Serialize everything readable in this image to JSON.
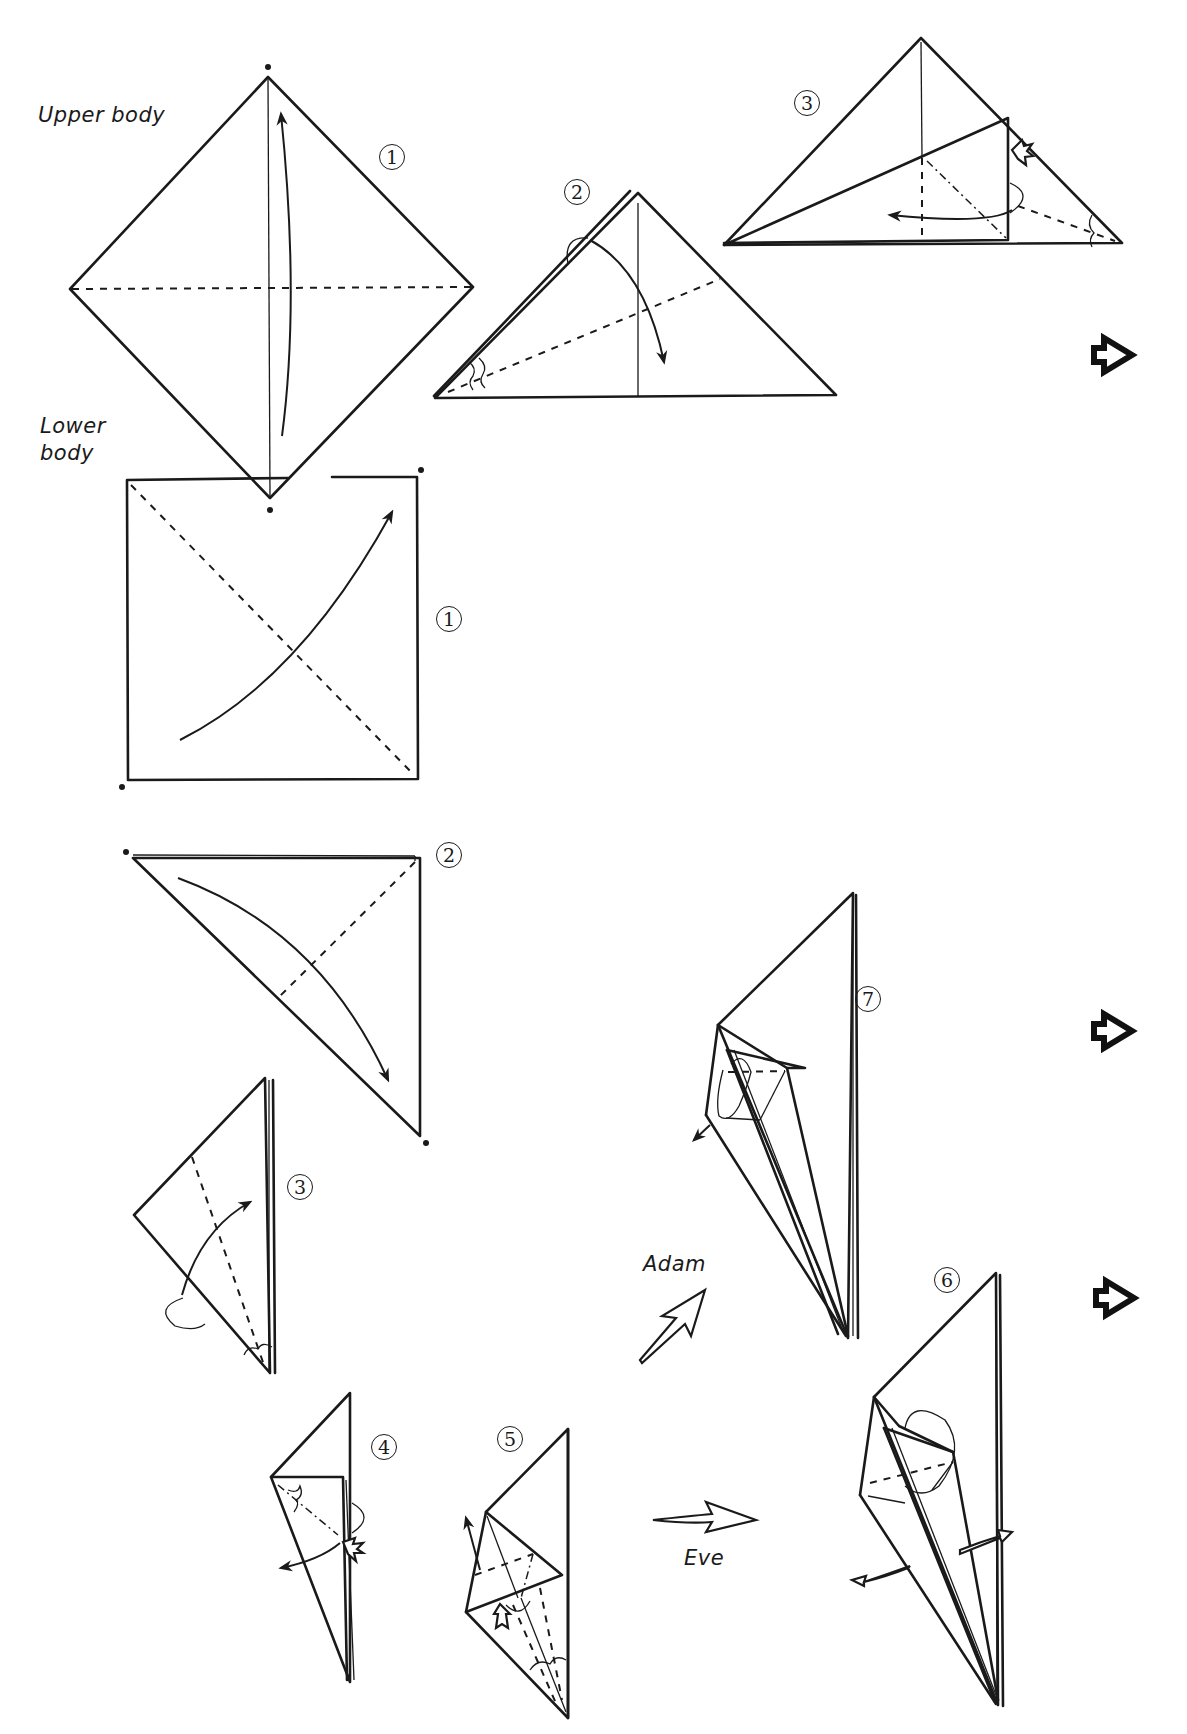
{
  "labels": {
    "upper_body": "Upper body",
    "lower_body": "Lower body",
    "adam": "Adam",
    "eve": "Eve"
  },
  "upper_body_steps": [
    {
      "number": "1",
      "glyph": "①"
    },
    {
      "number": "2",
      "glyph": "②"
    },
    {
      "number": "3",
      "glyph": "③"
    }
  ],
  "lower_body_steps": [
    {
      "number": "1",
      "glyph": "①"
    },
    {
      "number": "2",
      "glyph": "②"
    },
    {
      "number": "3",
      "glyph": "③"
    },
    {
      "number": "4",
      "glyph": "④"
    },
    {
      "number": "5",
      "glyph": "⑤"
    },
    {
      "number": "6",
      "glyph": "⑥"
    },
    {
      "number": "7",
      "glyph": "⑦"
    }
  ],
  "icons": {
    "next_arrow": "bold-hollow-right-arrow",
    "fold_arrow": "curved-fold-arrow",
    "push_arrow": "hollow-push-arrow",
    "reference_dot": "dot"
  },
  "colors": {
    "ink": "#1a1a1a",
    "paper": "#ffffff"
  }
}
